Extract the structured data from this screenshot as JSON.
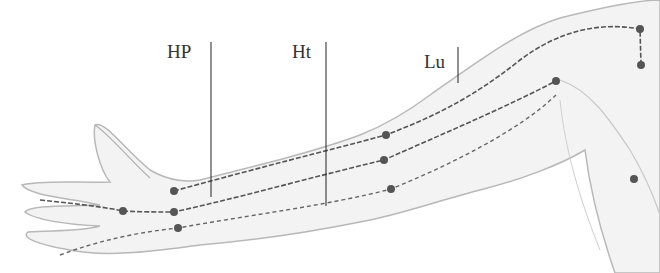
{
  "diagram": {
    "labels": [
      {
        "id": "hp",
        "text": "HP",
        "x": 167,
        "y": 42,
        "line_x": 211,
        "line_y1": 42,
        "line_y2": 197
      },
      {
        "id": "ht",
        "text": "Ht",
        "x": 292,
        "y": 42,
        "line_x": 326,
        "line_y1": 42,
        "line_y2": 206
      },
      {
        "id": "lu",
        "text": "Lu",
        "x": 424,
        "y": 52,
        "line_x": 458,
        "line_y1": 47,
        "line_y2": 83
      }
    ],
    "points": [
      {
        "x": 174,
        "y": 191
      },
      {
        "x": 123,
        "y": 211
      },
      {
        "x": 174,
        "y": 212
      },
      {
        "x": 178,
        "y": 228
      },
      {
        "x": 386,
        "y": 135
      },
      {
        "x": 384,
        "y": 160
      },
      {
        "x": 391,
        "y": 189
      },
      {
        "x": 556,
        "y": 81
      },
      {
        "x": 640,
        "y": 29
      },
      {
        "x": 641,
        "y": 65
      },
      {
        "x": 634,
        "y": 179
      }
    ],
    "colors": {
      "line": "#444444",
      "point": "#555555",
      "skin_stroke": "#b5b5b5",
      "skin_fill": "#f2f2f2"
    }
  }
}
